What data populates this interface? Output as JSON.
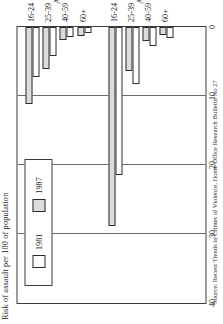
{
  "figure": {
    "value_axis_title": "Risk of assault per 100 of population",
    "source_note": "Source: Recent Trends in Crimes of Violence, Home Office Research Bulletin No 27"
  },
  "legend": {
    "entries": [
      {
        "label": "1981",
        "swatch": "white-swatch",
        "color": "#ffffff"
      },
      {
        "label": "1987",
        "swatch": "grey-swatch",
        "color": "#dcdcdc"
      }
    ]
  },
  "chart_data": {
    "type": "bar",
    "title": "Risk of assault per 100 of population",
    "xlabel": "Age",
    "ylabel": "Risk of assault per 100 of population",
    "orientation": "horizontal",
    "ylim": [
      0,
      40
    ],
    "ticks": [
      40,
      30,
      20,
      10,
      0
    ],
    "grid": true,
    "legend_position": "top-left",
    "groups": [
      {
        "name": "Age (men)",
        "categories": [
          "16-24",
          "25-39",
          "40-59",
          "60+"
        ],
        "series": [
          {
            "name": "1981",
            "values": [
              21.5,
              8.2,
              2.8,
              1.6
            ]
          },
          {
            "name": "1987",
            "values": [
              28.8,
              6.4,
              2.1,
              1.2
            ]
          }
        ]
      },
      {
        "name": "Age (women)",
        "categories": [
          "16-24",
          "25-39",
          "40-59",
          "60+"
        ],
        "series": [
          {
            "name": "1981",
            "values": [
              7.3,
              4.2,
              1.5,
              0.9
            ]
          },
          {
            "name": "1987",
            "values": [
              11.1,
              6.1,
              1.9,
              1.3
            ]
          }
        ]
      }
    ]
  }
}
